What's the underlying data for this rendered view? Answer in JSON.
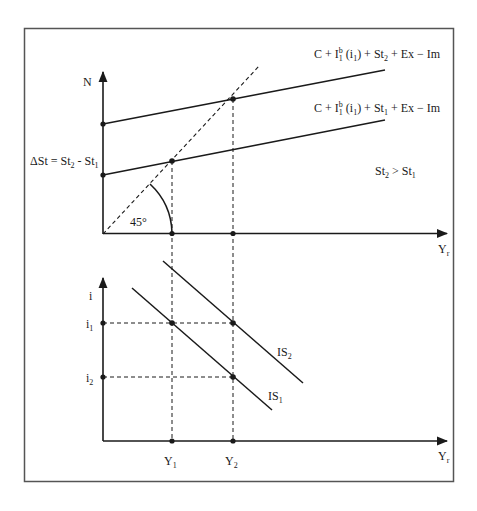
{
  "diagram": {
    "top_panel": {
      "y_axis_label": "N",
      "x_axis_label": "Y",
      "x_axis_label_sub": "r",
      "angle_label": "45°",
      "delta_label": "ΔSt = St",
      "delta_label_sub2": "2",
      "delta_label_mid": " - St",
      "delta_label_sub1": "1",
      "condition_label": "St",
      "condition_sub2": "2",
      "condition_mid": " > St",
      "condition_sub1": "1",
      "line_upper": {
        "prefix": "C + I",
        "sup": "b",
        "sub": "1",
        "paren": " (i",
        "paren_sub": "1",
        "mid": ") + St",
        "st_sub": "2",
        "suffix": " + Ex − Im"
      },
      "line_lower": {
        "prefix": "C + I",
        "sup": "b",
        "sub": "1",
        "paren": " (i",
        "paren_sub": "1",
        "mid": ") + St",
        "st_sub": "1",
        "suffix": " + Ex − Im"
      }
    },
    "bottom_panel": {
      "y_axis_label": "i",
      "x_axis_label": "Y",
      "x_axis_label_sub": "r",
      "i1": "i",
      "i1_sub": "1",
      "i2": "i",
      "i2_sub": "2",
      "y1": "Y",
      "y1_sub": "1",
      "y2": "Y",
      "y2_sub": "2",
      "is1": "IS",
      "is1_sub": "1",
      "is2": "IS",
      "is2_sub": "2"
    },
    "colors": {
      "stroke": "#1a1a1a",
      "frame": "#555555",
      "background": "#ffffff"
    }
  }
}
